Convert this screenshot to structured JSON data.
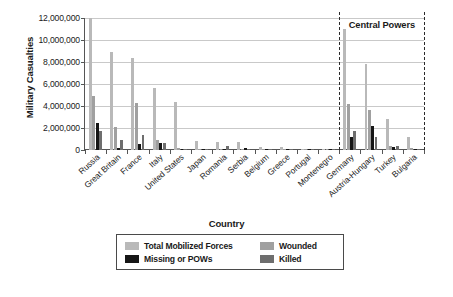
{
  "chart_data": {
    "type": "bar",
    "title": "",
    "xlabel": "Country",
    "ylabel": "Military Casualties",
    "ylim": [
      0,
      12000000
    ],
    "ytick_values": [
      0,
      2000000,
      4000000,
      6000000,
      8000000,
      10000000,
      12000000
    ],
    "ytick_labels": [
      "0",
      "2,000,000",
      "4,000,000",
      "6,000,000",
      "8,000,000",
      "10,000,000",
      "12,000,000"
    ],
    "grid": true,
    "legend_position": "below-plot",
    "annotations": [
      {
        "text": "Central Powers",
        "position": "top-right",
        "bracket_start_category": "Germany",
        "bracket_end_category": "Bulgaria"
      }
    ],
    "categories": [
      "Russia",
      "Great Britain",
      "France",
      "Italy",
      "United States",
      "Japan",
      "Romania",
      "Serbia",
      "Belgium",
      "Greece",
      "Portugal",
      "Montenegro",
      "Germany",
      "Austria-Hungary",
      "Turkey",
      "Bulgaria"
    ],
    "series": [
      {
        "name": "Total Mobilized Forces",
        "color": "#b9b9b9",
        "values": [
          12000000,
          8904467,
          8410000,
          5615000,
          4355000,
          800000,
          750000,
          707343,
          267000,
          230000,
          100000,
          50000,
          11000000,
          7800000,
          2850000,
          1200000
        ]
      },
      {
        "name": "Wounded",
        "color": "#a0a0a0",
        "values": [
          4950000,
          2090212,
          4266000,
          947000,
          204002,
          907,
          120000,
          133148,
          44686,
          21000,
          13751,
          10000,
          4216058,
          3620000,
          400000,
          152390
        ]
      },
      {
        "name": "Missing or POWs",
        "color": "#161616",
        "values": [
          2500000,
          191652,
          537000,
          600000,
          4500,
          3,
          80000,
          152958,
          34659,
          1000,
          12318,
          7000,
          1152800,
          2200000,
          250000,
          27029
        ]
      },
      {
        "name": "Killed",
        "color": "#6e6e6e",
        "values": [
          1700000,
          908371,
          1357800,
          650000,
          116516,
          300,
          335706,
          45000,
          13716,
          5000,
          7222,
          3000,
          1773700,
          1200000,
          325000,
          87500
        ]
      }
    ]
  },
  "legend": {
    "entries": [
      {
        "label": "Total Mobilized Forces",
        "swatch": "total"
      },
      {
        "label": "Wounded",
        "swatch": "wounded"
      },
      {
        "label": "Missing or POWs",
        "swatch": "missing"
      },
      {
        "label": "Killed",
        "swatch": "killed"
      }
    ]
  }
}
